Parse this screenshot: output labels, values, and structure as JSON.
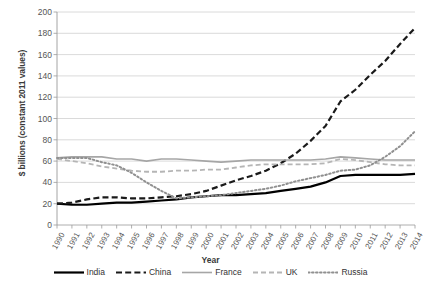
{
  "chart_data": {
    "type": "line",
    "title": "",
    "xlabel": "Year",
    "ylabel": "$ billions (constant 2011 values)",
    "xlim": [
      1990,
      2014
    ],
    "ylim": [
      0,
      200
    ],
    "ytick_step": 20,
    "grid": true,
    "legend_position": "bottom",
    "x": [
      1990,
      1991,
      1992,
      1993,
      1994,
      1995,
      1996,
      1997,
      1998,
      1999,
      2000,
      2001,
      2002,
      2003,
      2004,
      2005,
      2006,
      2007,
      2008,
      2009,
      2010,
      2011,
      2012,
      2013,
      2014
    ],
    "categories": [
      "1990",
      "1991",
      "1992",
      "1993",
      "1994",
      "1995",
      "1996",
      "1997",
      "1998",
      "1999",
      "2000",
      "2001",
      "2002",
      "2003",
      "2004",
      "2005",
      "2006",
      "2007",
      "2008",
      "2009",
      "2010",
      "2011",
      "2012",
      "2013",
      "2014"
    ],
    "ytick_labels": [
      "0",
      "20",
      "40",
      "60",
      "80",
      "100",
      "120",
      "140",
      "160",
      "180",
      "200"
    ],
    "series": [
      {
        "name": "India",
        "color": "#000000",
        "style": "solid",
        "width": 2.2,
        "values": [
          20,
          19,
          19,
          20,
          21,
          21,
          22,
          23,
          24,
          26,
          27,
          28,
          28,
          29,
          30,
          32,
          34,
          36,
          40,
          46,
          47,
          47,
          47,
          47,
          48
        ]
      },
      {
        "name": "China",
        "color": "#1a1a1a",
        "style": "dashed",
        "width": 2.2,
        "values": [
          20,
          21,
          24,
          26,
          26,
          25,
          25,
          26,
          27,
          29,
          32,
          37,
          42,
          46,
          51,
          58,
          67,
          79,
          93,
          116,
          127,
          141,
          154,
          170,
          185
        ]
      },
      {
        "name": "France",
        "color": "#a6a6a6",
        "style": "solid",
        "width": 1.6,
        "values": [
          63,
          64,
          64,
          64,
          62,
          62,
          60,
          62,
          62,
          61,
          60,
          59,
          60,
          61,
          61,
          61,
          61,
          61,
          62,
          64,
          63,
          62,
          61,
          61,
          61
        ]
      },
      {
        "name": "UK",
        "color": "#b5b5b5",
        "style": "dashed",
        "width": 1.8,
        "values": [
          62,
          60,
          58,
          55,
          53,
          51,
          50,
          50,
          51,
          51,
          52,
          52,
          54,
          56,
          57,
          57,
          57,
          57,
          58,
          62,
          61,
          59,
          57,
          56,
          56
        ]
      },
      {
        "name": "Russia",
        "color": "#909090",
        "style": "dotted",
        "width": 2.0,
        "values": [
          63,
          63,
          63,
          59,
          56,
          49,
          40,
          32,
          25,
          26,
          27,
          28,
          30,
          32,
          34,
          37,
          41,
          44,
          47,
          51,
          52,
          56,
          64,
          74,
          88
        ]
      }
    ]
  },
  "axes": {
    "x_title": "Year",
    "y_title": "$ billions (constant 2011 values)"
  },
  "legend": {
    "items": [
      {
        "label": "India",
        "swatch": "solid-black-line-icon"
      },
      {
        "label": "China",
        "swatch": "dashed-black-line-icon"
      },
      {
        "label": "France",
        "swatch": "solid-gray-line-icon"
      },
      {
        "label": "UK",
        "swatch": "dashed-gray-line-icon"
      },
      {
        "label": "Russia",
        "swatch": "dotted-gray-line-icon"
      }
    ]
  }
}
